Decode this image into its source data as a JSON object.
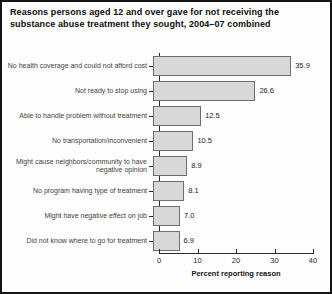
{
  "title": "Reasons persons aged 12 and over gave for not receiving the substance abuse treatment they sought, 2004–07 combined",
  "chart_data": {
    "type": "bar",
    "orientation": "horizontal",
    "categories": [
      "No health coverage and could not afford cost",
      "Not ready to stop using",
      "Able to handle problem without treatment",
      "No transportation/inconvenient",
      "Might cause neighbors/community to have negative opinion",
      "No program having type of treatment",
      "Might have negative effect on job",
      "Did not know where to go for treatment"
    ],
    "values": [
      35.9,
      26.6,
      12.5,
      10.5,
      8.9,
      8.1,
      7.0,
      6.9
    ],
    "value_labels": [
      "35.9",
      "26.6",
      "12.5",
      "10.5",
      "8.9",
      "8.1",
      "7.0",
      "6.9"
    ],
    "xlabel": "Percent reporting reason",
    "xlim": [
      0,
      40
    ],
    "xticks": [
      0,
      10,
      20,
      30,
      40
    ],
    "grid": "off",
    "legend": "none",
    "bar_color": "#d8d8d8",
    "bar_border_color": "#6e6e6e"
  }
}
